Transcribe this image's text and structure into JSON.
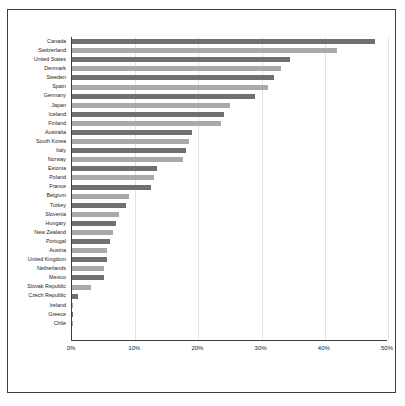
{
  "chart_data": {
    "type": "bar",
    "orientation": "horizontal",
    "title": "",
    "subtitle": "",
    "xlabel": "",
    "ylabel": "",
    "xlim": [
      0,
      50
    ],
    "xticks": [
      "0%",
      "10%",
      "20%",
      "30%",
      "40%",
      "50%"
    ],
    "xtick_values": [
      0,
      10,
      20,
      30,
      40,
      50
    ],
    "grid": "vertical",
    "legend": "none",
    "value_suffix": "%",
    "colors": {
      "bar_dark": "#707070",
      "bar_light": "#a9a9a9",
      "gridline": "#e2e2e2",
      "axis": "#3d3d3d",
      "frame": "#3d3d3d",
      "background": "#ffffff",
      "text": "#1d1d1d"
    },
    "categories": [
      "Canada",
      "Switzerland",
      "United States",
      "Denmark",
      "Sweden",
      "Spain",
      "Germany",
      "Japan",
      "Iceland",
      "Finland",
      "Australia",
      "South Korea",
      "Italy",
      "Norway",
      "Estonia",
      "Poland",
      "France",
      "Belgium",
      "Turkey",
      "Slovenia",
      "Hungary",
      "New Zealand",
      "Portugal",
      "Austria",
      "United Kingdom",
      "Netherlands",
      "Mexico",
      "Slovak Republic",
      "Czech Republic",
      "Ireland",
      "Greece",
      "Chile"
    ],
    "values": [
      48.0,
      42.0,
      34.5,
      33.0,
      32.0,
      31.0,
      29.0,
      25.0,
      24.0,
      23.5,
      19.0,
      18.5,
      18.0,
      17.5,
      13.5,
      13.0,
      12.5,
      9.0,
      8.5,
      7.5,
      7.0,
      6.5,
      6.0,
      5.5,
      5.5,
      5.0,
      5.0,
      3.0,
      1.0,
      0.2,
      0.2,
      0.2
    ]
  }
}
